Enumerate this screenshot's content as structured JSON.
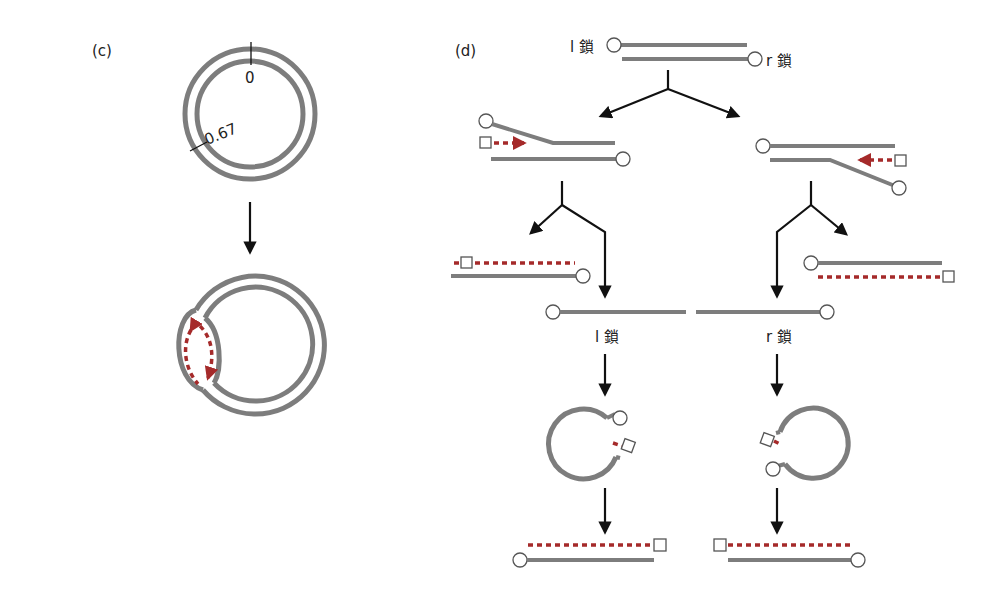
{
  "figure": {
    "panel_c": {
      "label": "(c)",
      "marker_zero": "0",
      "marker_067": "0.67",
      "description": "circular double-stranded DNA; origin at 0, second origin at 0.67; below: D-loop replication intermediate"
    },
    "panel_d": {
      "label": "(d)",
      "l_strand": "l 鎖",
      "r_strand": "r 鎖",
      "mid_l_label": "l 鎖",
      "mid_r_label": "r 鎖"
    },
    "colors": {
      "strand": "#7d7d7d",
      "primer": "#a52a2a",
      "arrow": "#111111"
    }
  }
}
